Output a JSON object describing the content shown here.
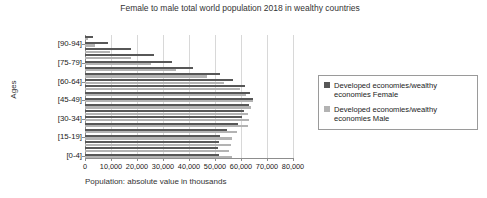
{
  "chart_data": {
    "type": "bar",
    "orientation": "horizontal",
    "title": "Female to male total world population 2018 in wealthy countries",
    "xlabel": "Population: absolute value in thousands",
    "ylabel": "Ages",
    "xlim": [
      0,
      80000
    ],
    "xticks": [
      0,
      10000,
      20000,
      30000,
      40000,
      50000,
      60000,
      70000,
      80000
    ],
    "xtick_labels": [
      "0",
      "10,000",
      "20,000",
      "30,000",
      "40,000",
      "50,000",
      "60,000",
      "70,000",
      "80,000"
    ],
    "grid": true,
    "legend_position": "right",
    "categories": [
      "[95-99]",
      "[90-94]",
      "[85-89]",
      "[80-84]",
      "[75-79]",
      "[70-74]",
      "[65-69]",
      "[60-64]",
      "[55-59]",
      "[50-54]",
      "[45-49]",
      "[40-44]",
      "[35-39]",
      "[30-34]",
      "[25-29]",
      "[20-24]",
      "[15-19]",
      "[10-14]",
      "[5-9]",
      "[0-4]"
    ],
    "visible_category_labels": [
      "[90-94]",
      "[75-79]",
      "[60-64]",
      "[45-49]",
      "[30-34]",
      "[15-19]",
      "[0-4]"
    ],
    "series": [
      {
        "name": "Developed economies/wealthy economies Female",
        "color": "#575757",
        "values": [
          3200,
          9000,
          17500,
          26500,
          33500,
          41500,
          52000,
          57000,
          61500,
          63500,
          64500,
          63000,
          61000,
          60500,
          59000,
          54500,
          52000,
          51500,
          51000,
          51500
        ]
      },
      {
        "name": "Developed economies/wealthy economies Male",
        "color": "#b3b3b3",
        "values": [
          1100,
          3800,
          9500,
          17500,
          25500,
          35000,
          47000,
          53500,
          59500,
          62000,
          64500,
          64000,
          62500,
          63000,
          62500,
          58500,
          56500,
          56000,
          55500,
          56500
        ]
      }
    ]
  },
  "legend": {
    "items": [
      {
        "label": "Developed economies/wealthy economies Female",
        "color": "#575757"
      },
      {
        "label": "Developed economies/wealthy economies Male",
        "color": "#b3b3b3"
      }
    ]
  }
}
